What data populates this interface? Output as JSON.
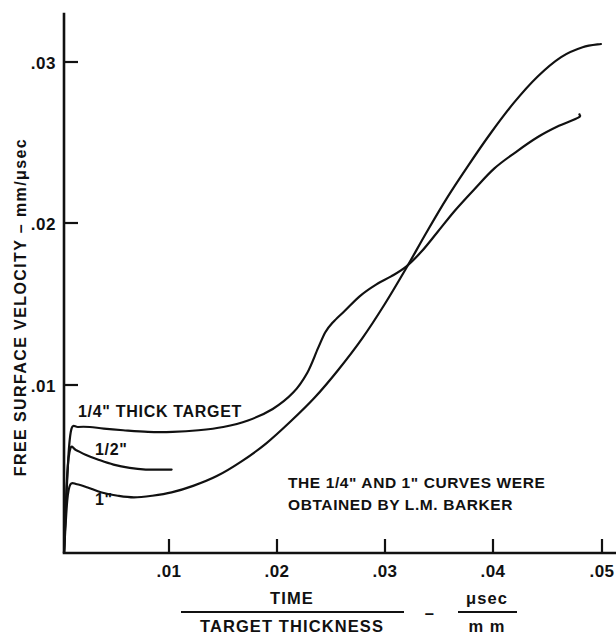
{
  "chart_data": {
    "type": "line",
    "title": "",
    "xlabel_numerator": "TIME",
    "xlabel_denominator": "TARGET  THICKNESS",
    "xlabel_dash": "–",
    "xunit_numerator": "μsec",
    "xunit_denominator": "m m",
    "ylabel": "FREE  SURFACE  VELOCITY – mm/μsec",
    "xlim": [
      0,
      0.053
    ],
    "ylim": [
      0,
      0.0334
    ],
    "grid": false,
    "legend": "inline-curve-labels",
    "xticks": [
      0.01,
      0.02,
      0.03,
      0.04,
      0.05
    ],
    "xtick_labels": [
      ".01",
      ".02",
      ".03",
      ".04",
      ".05"
    ],
    "yticks": [
      0.01,
      0.02,
      0.03
    ],
    "ytick_labels": [
      ".01",
      ".02",
      ".03"
    ],
    "annotations": [
      "THE 1/4\" AND 1\" CURVES WERE",
      "OBTAINED BY L.M. BARKER"
    ],
    "series": [
      {
        "name": "1/4\" THICK TARGET",
        "label": "1/4\" THICK  TARGET",
        "points": [
          [
            0.0,
            0.0
          ],
          [
            0.0004,
            0.0058
          ],
          [
            0.0007,
            0.0076
          ],
          [
            0.0013,
            0.0077
          ],
          [
            0.0024,
            0.0077
          ],
          [
            0.0037,
            0.0076
          ],
          [
            0.0055,
            0.0075
          ],
          [
            0.0078,
            0.0074
          ],
          [
            0.0101,
            0.0074
          ],
          [
            0.0125,
            0.0075
          ],
          [
            0.0148,
            0.0077
          ],
          [
            0.0171,
            0.0081
          ],
          [
            0.0194,
            0.0088
          ],
          [
            0.0213,
            0.0098
          ],
          [
            0.0226,
            0.011
          ],
          [
            0.0236,
            0.0125
          ],
          [
            0.0243,
            0.0135
          ],
          [
            0.025,
            0.0141
          ],
          [
            0.0261,
            0.0148
          ],
          [
            0.0275,
            0.0157
          ],
          [
            0.029,
            0.0164
          ],
          [
            0.0304,
            0.0169
          ],
          [
            0.0318,
            0.0175
          ],
          [
            0.0332,
            0.0184
          ],
          [
            0.0347,
            0.0196
          ],
          [
            0.0363,
            0.0209
          ],
          [
            0.0381,
            0.0222
          ],
          [
            0.04,
            0.0235
          ],
          [
            0.042,
            0.0245
          ],
          [
            0.044,
            0.0254
          ],
          [
            0.046,
            0.0261
          ],
          [
            0.0478,
            0.0266
          ],
          [
            0.0479,
            0.0268
          ]
        ]
      },
      {
        "name": "1/2\"",
        "label": "1/2\"",
        "points": [
          [
            0.0,
            0.0
          ],
          [
            0.0003,
            0.0048
          ],
          [
            0.0006,
            0.0064
          ],
          [
            0.0011,
            0.0063
          ],
          [
            0.002,
            0.006
          ],
          [
            0.0032,
            0.0057
          ],
          [
            0.0046,
            0.0054
          ],
          [
            0.0061,
            0.0052
          ],
          [
            0.0076,
            0.0051
          ],
          [
            0.009,
            0.0051
          ],
          [
            0.01,
            0.0051
          ]
        ]
      },
      {
        "name": "1\"",
        "label": "1\"",
        "points": [
          [
            0.0,
            0.0
          ],
          [
            0.0003,
            0.0032
          ],
          [
            0.0006,
            0.0042
          ],
          [
            0.0012,
            0.0042
          ],
          [
            0.0022,
            0.004
          ],
          [
            0.0035,
            0.0037
          ],
          [
            0.005,
            0.0035
          ],
          [
            0.0065,
            0.0034
          ],
          [
            0.0082,
            0.0035
          ],
          [
            0.01,
            0.0037
          ],
          [
            0.012,
            0.0041
          ],
          [
            0.0142,
            0.0047
          ],
          [
            0.0165,
            0.0056
          ],
          [
            0.0188,
            0.0067
          ],
          [
            0.021,
            0.008
          ],
          [
            0.0233,
            0.0095
          ],
          [
            0.0255,
            0.0112
          ],
          [
            0.0277,
            0.0131
          ],
          [
            0.0298,
            0.0152
          ],
          [
            0.0318,
            0.0174
          ],
          [
            0.0337,
            0.0196
          ],
          [
            0.0356,
            0.0217
          ],
          [
            0.0376,
            0.0237
          ],
          [
            0.0396,
            0.0256
          ],
          [
            0.0418,
            0.0275
          ],
          [
            0.044,
            0.0291
          ],
          [
            0.0462,
            0.0303
          ],
          [
            0.0482,
            0.0309
          ],
          [
            0.0499,
            0.0311
          ]
        ]
      }
    ]
  }
}
